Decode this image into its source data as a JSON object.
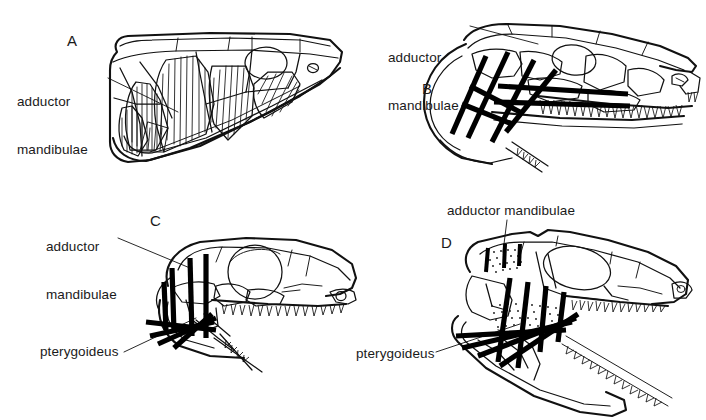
{
  "figure": {
    "background_color": "#ffffff",
    "ink_color": "#111111",
    "muscle_color": "#000000",
    "type": "scientific-line-drawing",
    "panel_count": 4
  },
  "panels": [
    {
      "id": "A",
      "letter": "A",
      "letter_pos": {
        "x": 67,
        "y": 32
      },
      "labels": [
        {
          "name": "adductor-mandibulae",
          "line1": "adductor",
          "line2": "mandibulae",
          "x": 17,
          "y": 62,
          "leader": true
        }
      ],
      "muscle_rendering": "hatched blocks",
      "muscle_groups": [
        "adductor mandibulae"
      ]
    },
    {
      "id": "B",
      "letter": "B",
      "letter_pos": {
        "x": 422,
        "y": 80
      },
      "labels": [
        {
          "name": "adductor-mandibulae",
          "line1": "adductor",
          "line2": "mandibulae",
          "x": 388,
          "y": 18,
          "leader": true
        }
      ],
      "muscle_rendering": "thick black bars",
      "muscle_groups": [
        "adductor mandibulae"
      ]
    },
    {
      "id": "C",
      "letter": "C",
      "letter_pos": {
        "x": 150,
        "y": 212
      },
      "labels": [
        {
          "name": "adductor-mandibulae",
          "line1": "adductor",
          "line2": "mandibulae",
          "x": 46,
          "y": 207,
          "leader": true
        },
        {
          "name": "pterygoideus",
          "line1": "pterygoideus",
          "line2": "",
          "x": 40,
          "y": 344,
          "leader": true
        }
      ],
      "muscle_rendering": "thick black bars",
      "muscle_groups": [
        "adductor mandibulae",
        "pterygoideus"
      ]
    },
    {
      "id": "D",
      "letter": "D",
      "letter_pos": {
        "x": 441,
        "y": 234
      },
      "labels": [
        {
          "name": "adductor-mandibulae",
          "line1": "adductor mandibulae",
          "line2": "",
          "x": 447,
          "y": 203,
          "leader": true
        },
        {
          "name": "pterygoideus",
          "line1": "pterygoideus",
          "line2": "",
          "x": 356,
          "y": 346,
          "leader": true
        }
      ],
      "muscle_rendering": "thick black bars with stippled fill",
      "muscle_groups": [
        "adductor mandibulae",
        "pterygoideus"
      ]
    }
  ]
}
